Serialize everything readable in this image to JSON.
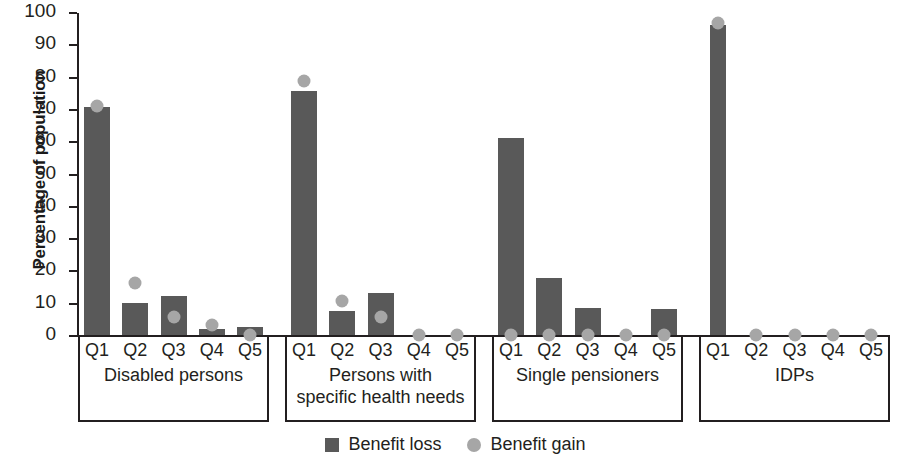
{
  "chart_data": {
    "type": "bar",
    "title": "",
    "xlabel": "",
    "ylabel": "Percentage of population",
    "ylim": [
      0,
      100
    ],
    "ytick_step": 10,
    "yticks": [
      100,
      90,
      80,
      70,
      60,
      50,
      40,
      30,
      20,
      10,
      0
    ],
    "grid": false,
    "legend_position": "bottom-center",
    "series": [
      {
        "name": "Benefit loss",
        "marker": "bar",
        "color": "#595959"
      },
      {
        "name": "Benefit gain",
        "marker": "circle",
        "color": "#a6a6a6"
      }
    ],
    "categories": [
      "Q1",
      "Q2",
      "Q3",
      "Q4",
      "Q5"
    ],
    "groups": [
      {
        "label": "Disabled persons",
        "label_lines": [
          "Disabled persons"
        ],
        "quintiles": [
          "Q1",
          "Q2",
          "Q3",
          "Q4",
          "Q5"
        ],
        "benefit_loss": [
          70.5,
          9.8,
          12.0,
          2.0,
          2.5
        ],
        "benefit_gain": [
          71.0,
          16.0,
          5.5,
          3.0,
          0.0
        ]
      },
      {
        "label": "Persons with specific health needs",
        "label_lines": [
          "Persons with",
          "specific health needs"
        ],
        "quintiles": [
          "Q1",
          "Q2",
          "Q3",
          "Q4",
          "Q5"
        ],
        "benefit_loss": [
          75.5,
          7.5,
          13.0,
          0.0,
          0.0
        ],
        "benefit_gain": [
          78.5,
          10.5,
          5.5,
          0.0,
          0.0
        ]
      },
      {
        "label": "Single pensioners",
        "label_lines": [
          "Single pensioners"
        ],
        "quintiles": [
          "Q1",
          "Q2",
          "Q3",
          "Q4",
          "Q5"
        ],
        "benefit_loss": [
          61.0,
          17.5,
          8.5,
          0.0,
          8.0
        ],
        "benefit_gain": [
          0.0,
          0.0,
          0.0,
          0.0,
          0.0
        ]
      },
      {
        "label": "IDPs",
        "label_lines": [
          "IDPs"
        ],
        "quintiles": [
          "Q1",
          "Q2",
          "Q3",
          "Q4",
          "Q5"
        ],
        "benefit_loss": [
          96.0,
          0.0,
          0.0,
          0.0,
          0.0
        ],
        "benefit_gain": [
          96.5,
          0.0,
          0.0,
          0.0,
          0.0
        ]
      }
    ]
  },
  "legend": {
    "items": [
      {
        "label": "Benefit loss",
        "swatch": "square"
      },
      {
        "label": "Benefit gain",
        "swatch": "circle"
      }
    ]
  }
}
